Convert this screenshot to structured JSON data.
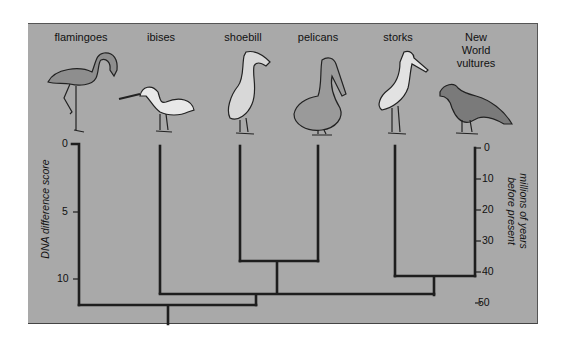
{
  "taxa": [
    {
      "id": "flamingoes",
      "label": "flamingoes",
      "x": 81,
      "label_y": 31
    },
    {
      "id": "ibises",
      "label": "ibises",
      "x": 161,
      "label_y": 31
    },
    {
      "id": "shoebill",
      "label": "shoebill",
      "x": 243,
      "label_y": 31
    },
    {
      "id": "pelicans",
      "label": "pelicans",
      "x": 318,
      "label_y": 31
    },
    {
      "id": "storks",
      "label": "storks",
      "x": 398,
      "label_y": 31
    },
    {
      "id": "vultures",
      "label_lines": [
        "New",
        "World",
        "vultures"
      ],
      "x": 476,
      "label_y": 31
    }
  ],
  "left_axis": {
    "title": "DNA difference score",
    "ticks": [
      {
        "label": "0",
        "y": 144
      },
      {
        "label": "5",
        "y": 212
      },
      {
        "label": "10",
        "y": 279
      }
    ]
  },
  "right_axis": {
    "title_lines": [
      "millions of years",
      "before present"
    ],
    "ticks": [
      {
        "label": "0",
        "y": 148
      },
      {
        "label": "10",
        "y": 179
      },
      {
        "label": "20",
        "y": 210
      },
      {
        "label": "30",
        "y": 241
      },
      {
        "label": "40",
        "y": 272
      },
      {
        "label": "50",
        "y": 303
      }
    ]
  },
  "tree": {
    "clades": [
      {
        "name": "shoebill+pelicans",
        "dna_score": 8.7,
        "mya": 37
      },
      {
        "name": "storks+New World vultures",
        "dna_score": 9.7,
        "mya": 41
      },
      {
        "name": "ibises+(shoebill,pelicans)+(storks,vultures)",
        "dna_score": 11.0,
        "mya": 47
      },
      {
        "name": "root (flamingoes + rest)",
        "dna_score": 11.9,
        "mya": 51
      }
    ]
  },
  "colors": {
    "panel_bg": "#a9a9a9",
    "line": "#1e1e1e",
    "text": "#111111"
  }
}
